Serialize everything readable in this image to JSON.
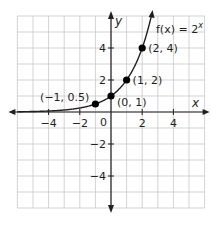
{
  "chart_data": {
    "type": "line",
    "title": "",
    "function_label": "f(x) = 2^x",
    "function_label_parts": {
      "lhs": "f(x) = 2",
      "exp": "x"
    },
    "xlabel": "x",
    "ylabel": "y",
    "xlim": [
      -6,
      6
    ],
    "ylim": [
      -6,
      6
    ],
    "grid": true,
    "grid_step": 1,
    "x_ticks": [
      -4,
      -2,
      2,
      4
    ],
    "x_tick_labels": [
      "−4",
      "−2",
      "2",
      "4"
    ],
    "y_ticks": [
      4,
      2,
      -2,
      -4
    ],
    "y_tick_labels": [
      "4",
      "2",
      "−2",
      "−4"
    ],
    "origin_label": "0",
    "series": [
      {
        "name": "f(x) = 2^x",
        "curve": "exponential base 2",
        "x_range": [
          -6,
          2.6
        ]
      }
    ],
    "points": [
      {
        "x": -1,
        "y": 0.5,
        "label": "(−1, 0.5)"
      },
      {
        "x": 0,
        "y": 1,
        "label": "(0, 1)"
      },
      {
        "x": 1,
        "y": 2,
        "label": "(1, 2)"
      },
      {
        "x": 2,
        "y": 4,
        "label": "(2, 4)"
      }
    ],
    "colors": {
      "grid": "#c8c8c8",
      "axis": "#231f20",
      "curve": "#231f20",
      "point": "#000000"
    }
  }
}
